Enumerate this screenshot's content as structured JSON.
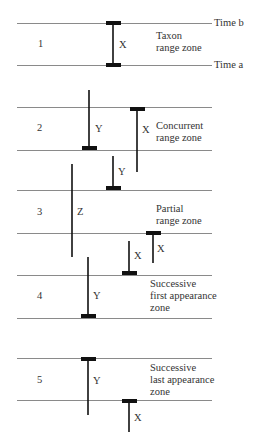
{
  "colors": {
    "line": "#8a8a8a",
    "bar": "#111111",
    "text": "#333333"
  },
  "line_x": [
    17,
    212
  ],
  "time_labels": [
    {
      "text": "Time b",
      "x": 214,
      "y": 17
    },
    {
      "text": "Time a",
      "x": 214,
      "y": 59
    }
  ],
  "lines_y": [
    23,
    65,
    107,
    150,
    190,
    233,
    275,
    318,
    358,
    400
  ],
  "zones": [
    {
      "number": "1",
      "number_pos": [
        38,
        38
      ],
      "name_lines": [
        "Taxon",
        "range zone"
      ],
      "name_pos": [
        156,
        30
      ],
      "taxa": [
        {
          "label": "X",
          "x": 113,
          "y1": 23,
          "y2": 65,
          "top_cap": true,
          "bottom_cap": true,
          "label_pos": [
            119,
            39
          ]
        }
      ]
    },
    {
      "number": "2",
      "number_pos": [
        37,
        122
      ],
      "name_lines": [
        "Concurrent",
        "range zone"
      ],
      "name_pos": [
        156,
        120
      ],
      "taxa": [
        {
          "label": "Y",
          "x": 89,
          "y1": 90,
          "y2": 148,
          "top_cap": false,
          "bottom_cap": true,
          "label_pos": [
            95,
            123
          ]
        },
        {
          "label": "X",
          "x": 137,
          "y1": 109,
          "y2": 172,
          "top_cap": true,
          "bottom_cap": false,
          "label_pos": [
            142,
            124
          ]
        },
        {
          "label": "Y",
          "x": 113,
          "y1": 156,
          "y2": 188,
          "top_cap": false,
          "bottom_cap": true,
          "label_pos": [
            118,
            166
          ]
        }
      ]
    },
    {
      "number": "3",
      "number_pos": [
        37,
        206
      ],
      "name_lines": [
        "Partial",
        "range zone"
      ],
      "name_pos": [
        156,
        203
      ],
      "taxa": [
        {
          "label": "Z",
          "x": 72,
          "y1": 164,
          "y2": 257,
          "top_cap": false,
          "bottom_cap": false,
          "label_pos": [
            77,
            206
          ]
        },
        {
          "label": "X",
          "x": 153,
          "y1": 233,
          "y2": 263,
          "top_cap": true,
          "bottom_cap": false,
          "label_pos": [
            157,
            243
          ]
        },
        {
          "label": "X",
          "x": 129,
          "y1": 241,
          "y2": 273,
          "top_cap": false,
          "bottom_cap": true,
          "label_pos": [
            134,
            250
          ]
        }
      ]
    },
    {
      "number": "4",
      "number_pos": [
        37,
        290
      ],
      "name_lines": [
        "Successive",
        "first appearance",
        "zone"
      ],
      "name_pos": [
        150,
        278
      ],
      "taxa": [
        {
          "label": "Y",
          "x": 88,
          "y1": 257,
          "y2": 316,
          "top_cap": false,
          "bottom_cap": true,
          "label_pos": [
            93,
            290
          ]
        }
      ]
    },
    {
      "number": "5",
      "number_pos": [
        37,
        374
      ],
      "name_lines": [
        "Successive",
        "last appearance",
        "zone"
      ],
      "name_pos": [
        150,
        362
      ],
      "taxa": [
        {
          "label": "Y",
          "x": 88,
          "y1": 359,
          "y2": 415,
          "top_cap": true,
          "bottom_cap": false,
          "label_pos": [
            93,
            375
          ]
        },
        {
          "label": "X",
          "x": 129,
          "y1": 401,
          "y2": 432,
          "top_cap": true,
          "bottom_cap": false,
          "label_pos": [
            134,
            412
          ]
        }
      ]
    }
  ]
}
